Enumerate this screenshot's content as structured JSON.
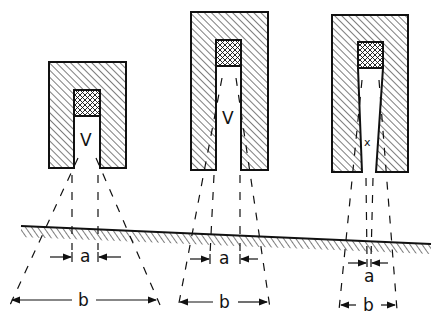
{
  "diagram": {
    "type": "technical-schematic",
    "colors": {
      "ink": "#111111",
      "background": "#ffffff"
    },
    "nozzles": [
      {
        "id": "nozzle-1",
        "shape": "short-straight-bore",
        "spray_label": "V",
        "inner_width_label": "a",
        "outer_width_label": "b"
      },
      {
        "id": "nozzle-2",
        "shape": "long-straight-bore",
        "spray_label": "V",
        "inner_width_label": "a",
        "outer_width_label": "b"
      },
      {
        "id": "nozzle-3",
        "shape": "long-tapered-bore",
        "spray_label": "X",
        "inner_width_label": "a",
        "outer_width_label": "b"
      }
    ],
    "surface": {
      "label": "sloped-ground-surface"
    }
  },
  "labels": {
    "n1_v": "V",
    "n2_v": "V",
    "n3_x": "x",
    "n1_a": "a",
    "n1_b": "b",
    "n2_a": "a",
    "n2_b": "b",
    "n3_a": "a",
    "n3_b": "b"
  }
}
